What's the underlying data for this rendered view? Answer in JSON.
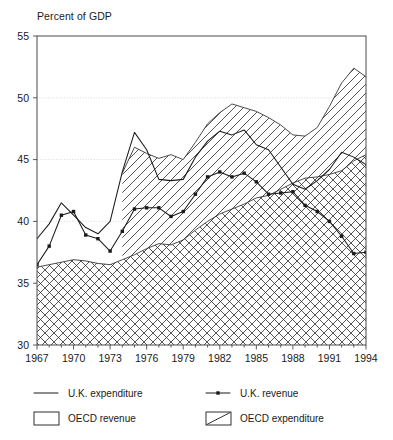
{
  "chart_data": {
    "type": "area",
    "title": "",
    "ylabel": "Percent of GDP",
    "xlabel": "",
    "ylim": [
      30,
      55
    ],
    "xlim": [
      1967,
      1994
    ],
    "yticks": [
      30,
      35,
      40,
      45,
      50,
      55
    ],
    "xticks_labeled": [
      1967,
      1970,
      1973,
      1976,
      1979,
      1982,
      1985,
      1988,
      1991,
      1994
    ],
    "xtick_step_minor": 1,
    "grid": "horizontal-dotted",
    "legend_position": "below-axes",
    "x": [
      1967,
      1968,
      1969,
      1970,
      1971,
      1972,
      1973,
      1974,
      1975,
      1976,
      1977,
      1978,
      1979,
      1980,
      1981,
      1982,
      1983,
      1984,
      1985,
      1986,
      1987,
      1988,
      1989,
      1990,
      1991,
      1992,
      1993,
      1994
    ],
    "series": [
      {
        "name": "U.K. expenditure",
        "style": "line",
        "values": [
          38.6,
          39.8,
          41.5,
          40.5,
          39.5,
          39.0,
          40.0,
          44.0,
          47.2,
          45.8,
          43.4,
          43.3,
          43.4,
          45.2,
          46.5,
          47.3,
          47.0,
          47.4,
          46.2,
          45.8,
          44.4,
          43.0,
          42.6,
          43.3,
          44.2,
          45.6,
          45.2,
          44.6
        ]
      },
      {
        "name": "U.K. revenue",
        "style": "line-markers",
        "values": [
          36.5,
          38.0,
          40.5,
          40.8,
          38.9,
          38.6,
          37.6,
          39.2,
          41.0,
          41.1,
          41.1,
          40.4,
          40.8,
          42.2,
          43.6,
          44.0,
          43.6,
          43.9,
          43.2,
          42.2,
          42.3,
          42.4,
          41.3,
          40.8,
          40.0,
          38.8,
          37.4,
          37.5
        ]
      },
      {
        "name": "OECD expenditure",
        "style": "area-diagonal-hatch",
        "values": [
          null,
          null,
          null,
          null,
          null,
          null,
          null,
          43.9,
          46.0,
          45.5,
          45.1,
          45.4,
          45.0,
          46.4,
          47.9,
          48.8,
          49.5,
          49.2,
          48.9,
          48.4,
          47.8,
          47.0,
          46.9,
          47.6,
          49.3,
          51.2,
          52.4,
          51.7
        ]
      },
      {
        "name": "OECD revenue",
        "style": "area-cross-hatch",
        "values": [
          36.3,
          36.5,
          36.7,
          36.9,
          36.8,
          36.6,
          36.5,
          36.9,
          37.3,
          37.8,
          38.2,
          38.1,
          38.5,
          39.3,
          40.0,
          40.6,
          41.0,
          41.4,
          41.9,
          42.1,
          42.6,
          43.1,
          43.5,
          43.6,
          43.8,
          44.1,
          44.9,
          45.4
        ]
      }
    ]
  },
  "axes": {
    "ylabel": "Percent of GDP",
    "ytick_labels": [
      "55",
      "50",
      "45",
      "40",
      "35",
      "30"
    ],
    "xtick_labels": [
      "1967",
      "1970",
      "1973",
      "1976",
      "1979",
      "1982",
      "1985",
      "1988",
      "1991",
      "1994"
    ]
  },
  "legend": {
    "entries": [
      {
        "label": "U.K. expenditure",
        "symbol": "plain-line"
      },
      {
        "label": "U.K. revenue",
        "symbol": "line-with-marker"
      },
      {
        "label": "OECD revenue",
        "symbol": "cross-hatch-box"
      },
      {
        "label": "OECD expenditure",
        "symbol": "diagonal-hatch-box"
      }
    ]
  }
}
